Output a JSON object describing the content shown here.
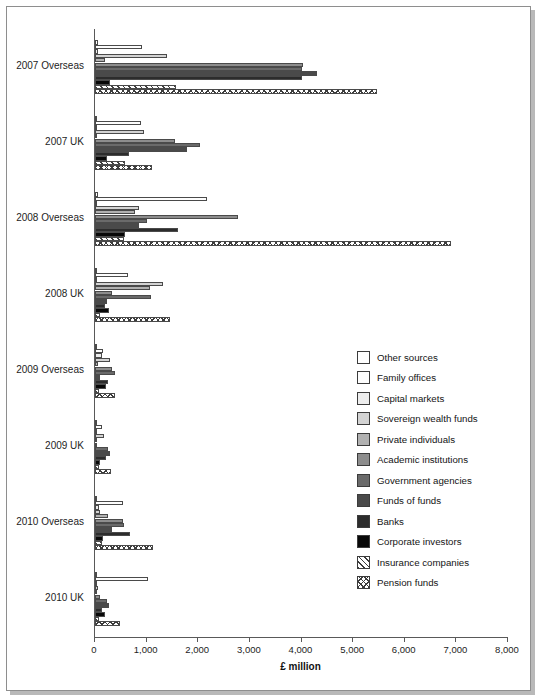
{
  "chart_data": {
    "type": "bar",
    "orientation": "horizontal",
    "title": "",
    "xlabel": "£ million",
    "ylabel": "",
    "xlim": [
      0,
      8000
    ],
    "xticks": [
      0,
      1000,
      2000,
      3000,
      4000,
      5000,
      6000,
      7000,
      8000
    ],
    "xticklabels": [
      "0",
      "1,000",
      "2,000",
      "3,000",
      "4,000",
      "5,000",
      "6,000",
      "7,000",
      "8,000"
    ],
    "grid": false,
    "legend_position": "center-right",
    "categories": [
      "2007 Overseas",
      "2007 UK",
      "2008 Overseas",
      "2008 UK",
      "2009 Overseas",
      "2009 UK",
      "2010 Overseas",
      "2010 UK"
    ],
    "series": [
      {
        "name": "Other sources",
        "color": "#ffffff",
        "pattern": "solid",
        "values": [
          55,
          40,
          50,
          30,
          45,
          20,
          40,
          35
        ]
      },
      {
        "name": "Family offices",
        "color": "#fdfdfd",
        "pattern": "solid",
        "values": [
          910,
          900,
          2170,
          640,
          160,
          135,
          545,
          1020
        ]
      },
      {
        "name": "Capital markets",
        "color": "#ededed",
        "pattern": "solid",
        "values": [
          60,
          45,
          35,
          40,
          130,
          30,
          75,
          40
        ]
      },
      {
        "name": "Sovereign wealth funds",
        "color": "#d3d3d3",
        "pattern": "solid",
        "values": [
          1390,
          950,
          860,
          1310,
          300,
          165,
          90,
          60
        ]
      },
      {
        "name": "Private individuals",
        "color": "#b1b1b1",
        "pattern": "solid",
        "values": [
          200,
          40,
          775,
          1060,
          60,
          35,
          250,
          40
        ]
      },
      {
        "name": "Academic institutions",
        "color": "#8d8d8d",
        "pattern": "solid",
        "values": [
          4020,
          1540,
          2770,
          320,
          330,
          45,
          545,
          95
        ]
      },
      {
        "name": "Government agencies",
        "color": "#6a6a6a",
        "pattern": "solid",
        "values": [
          4000,
          2040,
          1010,
          1090,
          390,
          260,
          560,
          225
        ]
      },
      {
        "name": "Funds of funds",
        "color": "#4a4a4a",
        "pattern": "solid",
        "values": [
          4300,
          1780,
          850,
          230,
          100,
          290,
          320,
          280
        ]
      },
      {
        "name": "Banks",
        "color": "#2c2c2c",
        "pattern": "solid",
        "values": [
          4010,
          660,
          1605,
          190,
          245,
          220,
          670,
          130
        ]
      },
      {
        "name": "Corporate investors",
        "color": "#080808",
        "pattern": "solid",
        "values": [
          300,
          230,
          590,
          270,
          215,
          95,
          155,
          195
        ]
      },
      {
        "name": "Insurance companies",
        "color": "#ffffff",
        "pattern": "diagonal",
        "values": [
          1570,
          590,
          555,
          100,
          70,
          80,
          135,
          85
        ]
      },
      {
        "name": "Pension funds",
        "color": "#ffffff",
        "pattern": "crosshatch",
        "values": [
          5460,
          1110,
          6890,
          1450,
          390,
          305,
          1120,
          485
        ]
      }
    ]
  },
  "legend": {
    "items": [
      {
        "label": "Other sources"
      },
      {
        "label": "Family offices"
      },
      {
        "label": "Capital markets"
      },
      {
        "label": "Sovereign wealth funds"
      },
      {
        "label": "Private individuals"
      },
      {
        "label": "Academic institutions"
      },
      {
        "label": "Government agencies"
      },
      {
        "label": "Funds of funds"
      },
      {
        "label": "Banks"
      },
      {
        "label": "Corporate investors"
      },
      {
        "label": "Insurance companies"
      },
      {
        "label": "Pension funds"
      }
    ]
  }
}
